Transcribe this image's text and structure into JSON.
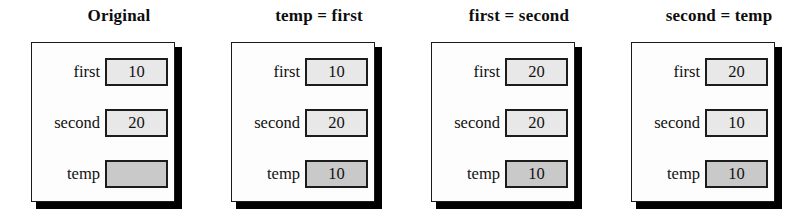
{
  "diagram": {
    "caption_absent": true,
    "variables": [
      "first",
      "second",
      "temp"
    ],
    "panels": [
      {
        "title": "Original",
        "rows": [
          {
            "label": "first",
            "value": "10",
            "shaded": false
          },
          {
            "label": "second",
            "value": "20",
            "shaded": false
          },
          {
            "label": "temp",
            "value": "",
            "shaded": true
          }
        ]
      },
      {
        "title": "temp = first",
        "rows": [
          {
            "label": "first",
            "value": "10",
            "shaded": false
          },
          {
            "label": "second",
            "value": "20",
            "shaded": false
          },
          {
            "label": "temp",
            "value": "10",
            "shaded": true
          }
        ]
      },
      {
        "title": "first = second",
        "rows": [
          {
            "label": "first",
            "value": "20",
            "shaded": false
          },
          {
            "label": "second",
            "value": "20",
            "shaded": false
          },
          {
            "label": "temp",
            "value": "10",
            "shaded": true
          }
        ]
      },
      {
        "title": "second = temp",
        "rows": [
          {
            "label": "first",
            "value": "20",
            "shaded": false
          },
          {
            "label": "second",
            "value": "10",
            "shaded": false
          },
          {
            "label": "temp",
            "value": "10",
            "shaded": true
          }
        ]
      }
    ]
  }
}
